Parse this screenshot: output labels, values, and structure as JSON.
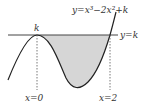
{
  "diagram": {
    "curve_label": "y=x³−2x²+k",
    "line_label": "y=k",
    "max_label": "k",
    "x0_label": "x=0",
    "x2_label": "x=2",
    "colors": {
      "stroke": "#222222",
      "fill": "#d6d6d6",
      "text": "#333333"
    }
  }
}
